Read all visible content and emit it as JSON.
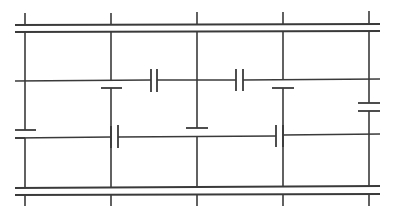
{
  "diagram": {
    "type": "capacitor-ladder-network",
    "stroke_color": "#3a3a3a",
    "background": "#ffffff",
    "buses": [
      {
        "name": "top-bus-upper",
        "x1": 15,
        "y1": 25,
        "x2": 380,
        "y2": 24
      },
      {
        "name": "top-bus-lower",
        "x1": 15,
        "y1": 32,
        "x2": 380,
        "y2": 31
      },
      {
        "name": "bottom-bus-upper",
        "x1": 15,
        "y1": 188,
        "x2": 380,
        "y2": 186
      },
      {
        "name": "bottom-bus-lower",
        "x1": 15,
        "y1": 195,
        "x2": 380,
        "y2": 194
      }
    ],
    "wires": [
      {
        "name": "top-tick-1",
        "x1": 25,
        "y1": 13,
        "x2": 25,
        "y2": 25
      },
      {
        "name": "top-tick-2",
        "x1": 111,
        "y1": 13,
        "x2": 111,
        "y2": 25
      },
      {
        "name": "top-tick-3",
        "x1": 197,
        "y1": 12,
        "x2": 197,
        "y2": 24
      },
      {
        "name": "top-tick-4",
        "x1": 283,
        "y1": 12,
        "x2": 283,
        "y2": 24
      },
      {
        "name": "top-tick-5",
        "x1": 369,
        "y1": 11,
        "x2": 369,
        "y2": 24
      },
      {
        "name": "bottom-tick-1",
        "x1": 25,
        "y1": 195,
        "x2": 25,
        "y2": 206
      },
      {
        "name": "bottom-tick-2",
        "x1": 111,
        "y1": 195,
        "x2": 111,
        "y2": 206
      },
      {
        "name": "bottom-tick-3",
        "x1": 197,
        "y1": 194,
        "x2": 197,
        "y2": 206
      },
      {
        "name": "bottom-tick-4",
        "x1": 283,
        "y1": 194,
        "x2": 283,
        "y2": 206
      },
      {
        "name": "bottom-tick-5",
        "x1": 369,
        "y1": 194,
        "x2": 369,
        "y2": 206
      },
      {
        "name": "col1-upper",
        "x1": 25,
        "y1": 32,
        "x2": 25,
        "y2": 130
      },
      {
        "name": "col1-lower",
        "x1": 25,
        "y1": 138,
        "x2": 25,
        "y2": 188
      },
      {
        "name": "col2-upper",
        "x1": 111,
        "y1": 32,
        "x2": 111,
        "y2": 81
      },
      {
        "name": "col2-lower",
        "x1": 111,
        "y1": 88,
        "x2": 111,
        "y2": 188
      },
      {
        "name": "col3-upper",
        "x1": 197,
        "y1": 31,
        "x2": 197,
        "y2": 128
      },
      {
        "name": "col3-lower",
        "x1": 197,
        "y1": 136,
        "x2": 197,
        "y2": 187
      },
      {
        "name": "col4-upper",
        "x1": 283,
        "y1": 31,
        "x2": 283,
        "y2": 80
      },
      {
        "name": "col4-lower",
        "x1": 283,
        "y1": 88,
        "x2": 283,
        "y2": 187
      },
      {
        "name": "col5-upper",
        "x1": 369,
        "y1": 31,
        "x2": 369,
        "y2": 103
      },
      {
        "name": "col5-lower",
        "x1": 369,
        "y1": 111,
        "x2": 369,
        "y2": 186
      },
      {
        "name": "row1-left",
        "x1": 15,
        "y1": 81,
        "x2": 151,
        "y2": 80
      },
      {
        "name": "row1-mid",
        "x1": 157,
        "y1": 80,
        "x2": 236,
        "y2": 80
      },
      {
        "name": "row1-right",
        "x1": 243,
        "y1": 80,
        "x2": 380,
        "y2": 79
      },
      {
        "name": "row2-left",
        "x1": 15,
        "y1": 138,
        "x2": 111,
        "y2": 137
      },
      {
        "name": "row2-mid",
        "x1": 118,
        "y1": 137,
        "x2": 276,
        "y2": 136
      },
      {
        "name": "row2-right",
        "x1": 283,
        "y1": 135,
        "x2": 380,
        "y2": 134
      }
    ],
    "capacitors": [
      {
        "name": "capacitor-row1-a",
        "orientation": "vertical-plates",
        "plate1": {
          "x1": 151,
          "y1": 69,
          "x2": 151,
          "y2": 92
        },
        "plate2": {
          "x1": 157,
          "y1": 69,
          "x2": 157,
          "y2": 92
        }
      },
      {
        "name": "capacitor-row1-b",
        "orientation": "vertical-plates",
        "plate1": {
          "x1": 236,
          "y1": 69,
          "x2": 236,
          "y2": 91
        },
        "plate2": {
          "x1": 243,
          "y1": 69,
          "x2": 243,
          "y2": 91
        }
      },
      {
        "name": "capacitor-col1",
        "orientation": "horizontal-plates",
        "plate1": {
          "x1": 15,
          "y1": 130,
          "x2": 36,
          "y2": 130
        },
        "plate2": {
          "x1": 15,
          "y1": 138,
          "x2": 25,
          "y2": 138
        }
      },
      {
        "name": "capacitor-col2",
        "orientation": "horizontal-plates",
        "plate1": {
          "x1": 111,
          "y1": 81,
          "x2": 111,
          "y2": 81
        },
        "plate2": {
          "x1": 101,
          "y1": 88,
          "x2": 122,
          "y2": 88
        }
      },
      {
        "name": "capacitor-col3",
        "orientation": "horizontal-plates",
        "plate1": {
          "x1": 186,
          "y1": 128,
          "x2": 208,
          "y2": 128
        },
        "plate2": {
          "x1": 197,
          "y1": 136,
          "x2": 197,
          "y2": 136
        }
      },
      {
        "name": "capacitor-col4",
        "orientation": "horizontal-plates",
        "plate1": {
          "x1": 283,
          "y1": 80,
          "x2": 283,
          "y2": 80
        },
        "plate2": {
          "x1": 272,
          "y1": 88,
          "x2": 294,
          "y2": 88
        }
      },
      {
        "name": "capacitor-col5",
        "orientation": "horizontal-plates",
        "plate1": {
          "x1": 358,
          "y1": 103,
          "x2": 380,
          "y2": 103
        },
        "plate2": {
          "x1": 358,
          "y1": 111,
          "x2": 380,
          "y2": 111
        }
      },
      {
        "name": "capacitor-row2-a",
        "orientation": "vertical-plates",
        "plate1": {
          "x1": 111,
          "y1": 126,
          "x2": 111,
          "y2": 148
        },
        "plate2": {
          "x1": 118,
          "y1": 125,
          "x2": 118,
          "y2": 148
        }
      },
      {
        "name": "capacitor-row2-b",
        "orientation": "vertical-plates",
        "plate1": {
          "x1": 276,
          "y1": 125,
          "x2": 276,
          "y2": 147
        },
        "plate2": {
          "x1": 283,
          "y1": 125,
          "x2": 283,
          "y2": 147
        }
      }
    ]
  }
}
